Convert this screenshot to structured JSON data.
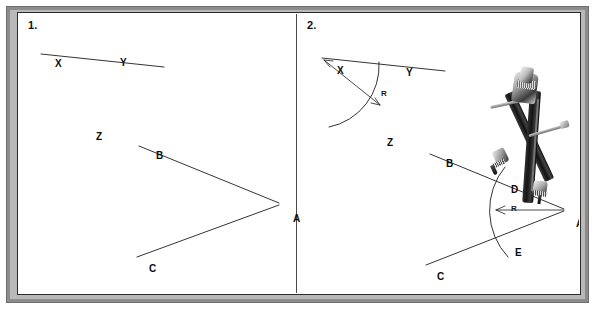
{
  "figure": {
    "background_color": "#ffffff",
    "frame_color": "#8c8c8c",
    "ink_color": "#1d1d1d"
  },
  "panels": [
    {
      "number_label": "1.",
      "name": "panel-given-figures",
      "labels": [
        {
          "id": "X",
          "text": "X",
          "x": 36,
          "y": 45
        },
        {
          "id": "Y",
          "text": "Y",
          "x": 101,
          "y": 44
        },
        {
          "id": "Z",
          "text": "Z",
          "x": 77,
          "y": 118
        },
        {
          "id": "B",
          "text": "B",
          "x": 137,
          "y": 137
        },
        {
          "id": "A",
          "text": "A",
          "x": 274,
          "y": 200
        },
        {
          "id": "C",
          "text": "C",
          "x": 130,
          "y": 250
        }
      ],
      "segments": [
        {
          "name": "ray-XY",
          "from": "X",
          "to": "Y-end"
        },
        {
          "name": "ray-AB",
          "from": "A",
          "to": "B"
        },
        {
          "name": "ray-AC",
          "from": "A",
          "to": "C"
        }
      ]
    },
    {
      "number_label": "2.",
      "name": "panel-compass-construction",
      "labels": [
        {
          "id": "X",
          "text": "X",
          "x": 318,
          "y": 52
        },
        {
          "id": "Y",
          "text": "Y",
          "x": 387,
          "y": 54
        },
        {
          "id": "Z",
          "text": "Z",
          "x": 368,
          "y": 124
        },
        {
          "id": "B",
          "text": "B",
          "x": 427,
          "y": 145
        },
        {
          "id": "D",
          "text": "D",
          "x": 492,
          "y": 171
        },
        {
          "id": "A",
          "text": "A",
          "x": 557,
          "y": 205
        },
        {
          "id": "E",
          "text": "E",
          "x": 496,
          "y": 234
        },
        {
          "id": "C",
          "text": "C",
          "x": 418,
          "y": 258
        }
      ],
      "radius_labels": [
        {
          "id": "R-top",
          "text": "R",
          "x": 362,
          "y": 76
        },
        {
          "id": "R-bottom",
          "text": "R",
          "x": 492,
          "y": 200
        }
      ],
      "segments": [
        {
          "name": "ray-XY",
          "from": "X",
          "to": "Y-end"
        },
        {
          "name": "ray-AB",
          "from": "A",
          "to": "B"
        },
        {
          "name": "ray-AC",
          "from": "A",
          "to": "C"
        }
      ],
      "arcs": [
        {
          "name": "arc-centered-at-X",
          "center": "X",
          "radius": 62
        },
        {
          "name": "arc-centered-at-A",
          "center": "A",
          "radius": 68
        }
      ],
      "intersection_points": [
        "D",
        "E"
      ]
    }
  ],
  "tool": {
    "name": "drafting-compass",
    "description": "metal drafting compass with needle point set on vertex A",
    "pivot_point": "A"
  }
}
